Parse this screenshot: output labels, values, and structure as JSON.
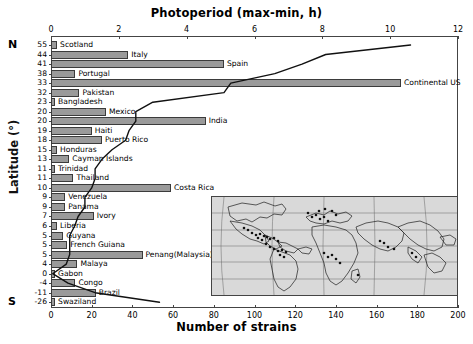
{
  "chart_data": {
    "type": "bar",
    "title": "Photoperiod (max-min, h)",
    "xlabel": "Number of strains",
    "ylabel": "Latitude (°)",
    "top_axis_label": "Photoperiod (max-min, h)",
    "bottom_axis_label": "Number of strains",
    "xlim": [
      0,
      200
    ],
    "xticks": [
      0,
      20,
      40,
      60,
      80,
      100,
      120,
      140,
      160,
      180,
      200
    ],
    "top_xlim": [
      0,
      12
    ],
    "top_xticks": [
      0,
      2,
      4,
      6,
      8,
      10,
      12
    ],
    "hemisphere_north": "N",
    "hemisphere_south": "S",
    "grid": false,
    "legend": null,
    "categories": [
      "Scotland",
      "Italy",
      "Spain",
      "Portugal",
      "Continental US",
      "Pakistan",
      "Bangladesh",
      "Mexico",
      "India",
      "Haiti",
      "Puerto Rico",
      "Honduras",
      "Cayman Islands",
      "Trinidad",
      "Thailand",
      "Costa Rica",
      "Venezuela",
      "Panama",
      "Ivory",
      "Liberia",
      "Guyana",
      "French Guiana",
      "Penang(Malaysia)",
      "Malaya",
      "Gabon",
      "Congo",
      "Brazil",
      "Swaziland"
    ],
    "latitudes": [
      55,
      44,
      41,
      38,
      33,
      32,
      23,
      20,
      20,
      19,
      18,
      15,
      13,
      11,
      11,
      10,
      9,
      9,
      7,
      6,
      5,
      5,
      5,
      4,
      0,
      -4,
      -11,
      -26
    ],
    "values": [
      3,
      38,
      85,
      12,
      172,
      14,
      2,
      27,
      76,
      20,
      25,
      3,
      9,
      2,
      11,
      59,
      7,
      7,
      21,
      3,
      6,
      8,
      45,
      13,
      2,
      12,
      22,
      2
    ],
    "bar_labels": [
      "Scotland",
      "Italy",
      "Spain",
      "Portugal",
      "Continental US",
      "Pakistan",
      "Bangladesh",
      "Mexico",
      "India",
      "Haiti",
      "Puerto Rico",
      "Honduras",
      "Cayman Islands",
      "Trinidad",
      "Thailand",
      "Costa Rica",
      "Venezuela",
      "Panama",
      "Ivory",
      "Liberia",
      "Guyana",
      "French Guiana",
      "Penang(Malaysia)",
      "Malaya",
      "Gabon",
      "Congo",
      "Brazil",
      "Swaziland"
    ],
    "photoperiod_series": {
      "name": "Photoperiod (max-min, h)",
      "x_hours": [
        10.6,
        8.1,
        7.4,
        6.6,
        5.3,
        5.1,
        3.0,
        2.5,
        2.5,
        2.3,
        2.2,
        1.8,
        1.5,
        1.3,
        1.3,
        1.2,
        1.0,
        1.0,
        0.8,
        0.7,
        0.55,
        0.55,
        0.55,
        0.45,
        0.05,
        0.5,
        1.3,
        3.2
      ],
      "y_latitudes": [
        55,
        44,
        41,
        38,
        33,
        32,
        23,
        20,
        20,
        19,
        18,
        15,
        13,
        11,
        11,
        10,
        9,
        9,
        7,
        6,
        5,
        5,
        5,
        4,
        0,
        -4,
        -11,
        -26
      ]
    },
    "inset": {
      "name": "world-map-inset",
      "description": "World map with sampling location markers"
    }
  }
}
